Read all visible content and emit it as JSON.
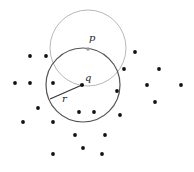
{
  "labels": {
    "p": "p",
    "q": "q",
    "r": "r"
  },
  "colors": {
    "background": "#ffffff",
    "point": "#111111",
    "p_point": "#999999",
    "light_circle": "#b8b8b8",
    "dark_circle": "#555555",
    "radius_line": "#333333"
  },
  "light_circle": {
    "cx": 88,
    "cy": 48,
    "r": 38
  },
  "dark_circle": {
    "cx": 83,
    "cy": 85,
    "r": 37
  },
  "p_point": {
    "x": 88,
    "y": 49
  },
  "q_point": {
    "x": 82,
    "y": 85
  },
  "radius_segment": {
    "x1": 82,
    "y1": 85,
    "x2": 50,
    "y2": 99
  },
  "label_positions": {
    "p": {
      "x": 89,
      "y": 41
    },
    "q": {
      "x": 85,
      "y": 81
    },
    "r": {
      "x": 62,
      "y": 102
    }
  },
  "points": [
    [
      30,
      56
    ],
    [
      46,
      56
    ],
    [
      135,
      52
    ],
    [
      15,
      83
    ],
    [
      30,
      83
    ],
    [
      53,
      83
    ],
    [
      124,
      69
    ],
    [
      159,
      69
    ],
    [
      147,
      85
    ],
    [
      181,
      85
    ],
    [
      117,
      91
    ],
    [
      155,
      102
    ],
    [
      38,
      108
    ],
    [
      79,
      112
    ],
    [
      94,
      112
    ],
    [
      120,
      115
    ],
    [
      23,
      122
    ],
    [
      53,
      122
    ],
    [
      75,
      135
    ],
    [
      105,
      135
    ],
    [
      83,
      148
    ],
    [
      53,
      154
    ],
    [
      102,
      154
    ]
  ]
}
